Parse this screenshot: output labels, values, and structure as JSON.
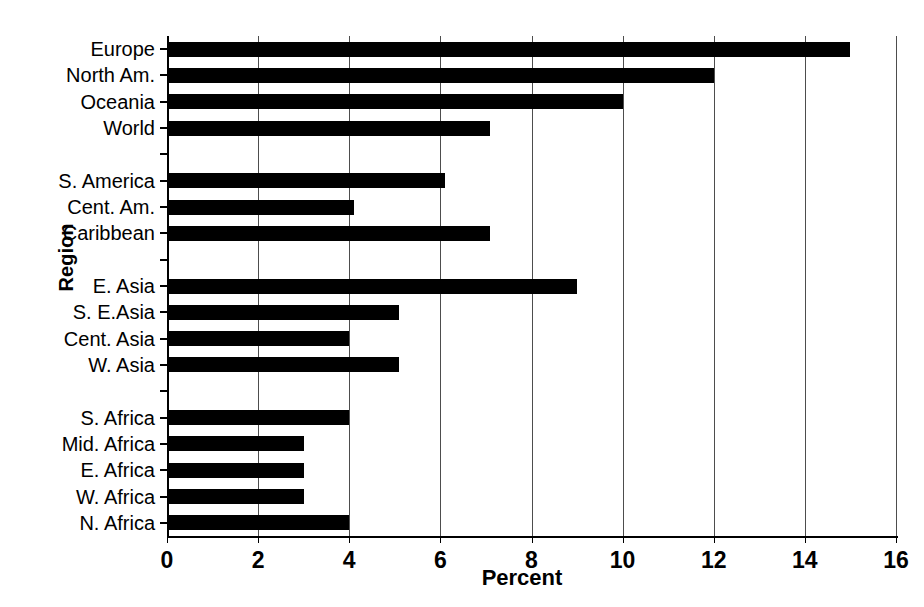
{
  "chart_data": {
    "type": "bar",
    "orientation": "horizontal",
    "title": "",
    "xlabel": "Percent",
    "ylabel": "Region",
    "xlim": [
      0,
      16
    ],
    "xticks": [
      0,
      2,
      4,
      6,
      8,
      10,
      12,
      14,
      16
    ],
    "grid": "vertical",
    "legend": "none",
    "bar_color": "#000000",
    "categories": [
      "Europe",
      "North  Am.",
      "Oceania",
      "World",
      "",
      "S. America",
      "Cent. Am.",
      "Caribbean",
      "",
      "E. Asia",
      "S. E.Asia",
      "Cent. Asia",
      "W. Asia",
      "",
      "S. Africa",
      "Mid. Africa",
      "E. Africa",
      "W. Africa",
      "N. Africa"
    ],
    "values": [
      15.0,
      12.0,
      10.0,
      7.1,
      null,
      6.1,
      4.1,
      7.1,
      null,
      9.0,
      5.1,
      4.0,
      5.1,
      null,
      4.0,
      3.0,
      3.0,
      3.0,
      4.0
    ]
  }
}
